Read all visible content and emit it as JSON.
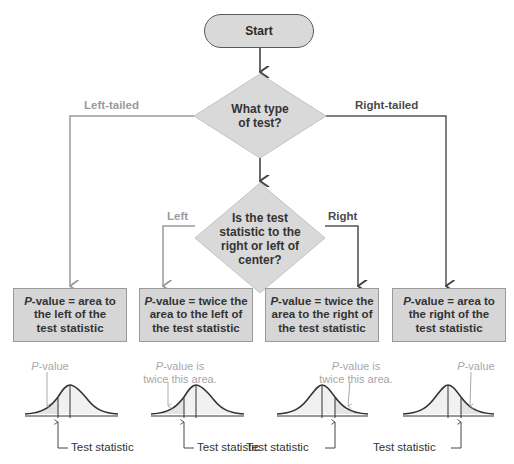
{
  "start": {
    "label": "Start"
  },
  "decision1": {
    "line1": "What type",
    "line2": "of test?",
    "left_label": "Left-tailed",
    "right_label": "Right-tailed"
  },
  "decision2": {
    "line1": "Is the test",
    "line2": "statistic to the",
    "line3": "right or left of",
    "line4": "center?",
    "left_label": "Left",
    "right_label": "Right"
  },
  "outcomes": [
    {
      "p": "P",
      "l1": "-value = area to",
      "l2": "the left of the",
      "l3": "test statistic"
    },
    {
      "p": "P",
      "l1": "-value = twice the",
      "l2": "area to the left of",
      "l3": "the test statistic"
    },
    {
      "p": "P",
      "l1": "-value = twice the",
      "l2": "area to the right of",
      "l3": "the test statistic"
    },
    {
      "p": "P",
      "l1": "-value = area to",
      "l2": "the right of the",
      "l3": "test statistic"
    }
  ],
  "curves": [
    {
      "note_p": "P",
      "note_l1": "-value",
      "note_l2": "",
      "ts_label": "Test statistic"
    },
    {
      "note_p": "P",
      "note_l1": "-value is",
      "note_l2": "twice this area.",
      "ts_label": "Test statistic"
    },
    {
      "note_p": "P",
      "note_l1": "-value is",
      "note_l2": "twice this area.",
      "ts_label": "Test statistic"
    },
    {
      "note_p": "P",
      "note_l1": "-value",
      "note_l2": "",
      "ts_label": "Test statistic"
    }
  ],
  "colors": {
    "gray_branch": "#9a9a9a",
    "dark_branch": "#555555",
    "shape_fill": "#d9d9d9",
    "curve_fill": "#e6e6e6"
  }
}
